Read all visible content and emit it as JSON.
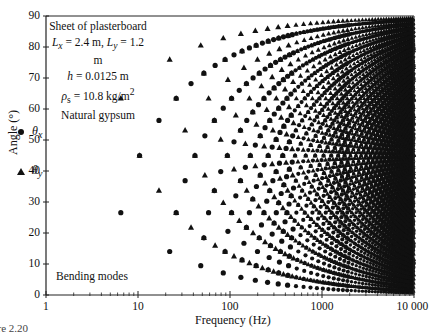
{
  "chart_data": {
    "type": "scatter",
    "title": "",
    "xlabel": "Frequency (Hz)",
    "ylabel": "Angle (°)",
    "xscale": "log",
    "xlim": [
      1,
      10000
    ],
    "ylim": [
      0,
      90
    ],
    "x_ticks": [
      "1",
      "10",
      "100",
      "1000",
      "10 000"
    ],
    "y_ticks": [
      "0",
      "10",
      "20",
      "30",
      "40",
      "50",
      "60",
      "70",
      "80",
      "90"
    ],
    "grid": false,
    "legend": [
      {
        "marker": "circle",
        "label": "θx"
      },
      {
        "marker": "triangle",
        "label": "θy"
      }
    ],
    "annotations": {
      "info_lines": [
        "Sheet of plasterboard",
        "Lx = 2.4 m, Ly = 1.2 m",
        "h = 0.0125 m",
        "ρs = 10.8 kg/m²",
        "Natural gypsum"
      ],
      "corner_text": "Bending modes"
    },
    "model": {
      "Lx": 2.4,
      "Ly": 1.2,
      "freq_constant": 7.49,
      "formula": "f = C*((m/Lx)^2 + (n/Ly)^2); thetay = atan((n/Ly)/(m/Lx)); thetax = 90 - thetay",
      "fmax": 10000
    },
    "series": [
      {
        "name": "θx",
        "marker": "circle",
        "points": [
          {
            "mode": "1,1",
            "x": 6.5,
            "y": 26.6
          },
          {
            "mode": "2,1",
            "x": 10.4,
            "y": 45.0
          },
          {
            "mode": "3,1",
            "x": 16.9,
            "y": 56.3
          },
          {
            "mode": "1,2",
            "x": 22.1,
            "y": 14.0
          },
          {
            "mode": "2,2",
            "x": 26.0,
            "y": 26.6
          },
          {
            "mode": "4,1",
            "x": 26.0,
            "y": 63.4
          },
          {
            "mode": "3,2",
            "x": 32.5,
            "y": 36.9
          },
          {
            "mode": "5,1",
            "x": 37.7,
            "y": 68.2
          },
          {
            "mode": "4,2",
            "x": 41.6,
            "y": 45.0
          },
          {
            "mode": "1,3",
            "x": 48.1,
            "y": 9.5
          }
        ]
      },
      {
        "name": "θy",
        "marker": "triangle",
        "points": [
          {
            "mode": "1,1",
            "x": 6.5,
            "y": 63.4
          },
          {
            "mode": "2,1",
            "x": 10.4,
            "y": 45.0
          },
          {
            "mode": "3,1",
            "x": 16.9,
            "y": 33.7
          },
          {
            "mode": "1,2",
            "x": 22.1,
            "y": 76.0
          },
          {
            "mode": "2,2",
            "x": 26.0,
            "y": 63.4
          },
          {
            "mode": "4,1",
            "x": 26.0,
            "y": 26.6
          },
          {
            "mode": "3,2",
            "x": 32.5,
            "y": 53.1
          },
          {
            "mode": "5,1",
            "x": 37.7,
            "y": 21.8
          },
          {
            "mode": "4,2",
            "x": 41.6,
            "y": 45.0
          },
          {
            "mode": "1,3",
            "x": 48.1,
            "y": 80.5
          }
        ]
      }
    ]
  },
  "figure": {
    "caption_fragment": "ure 2.20"
  },
  "colors": {
    "marker": "#111111",
    "axis": "#222222",
    "background": "#ffffff"
  },
  "info": {
    "line1": "Sheet of plasterboard",
    "lx_sym": "L",
    "lx_sub": "x",
    "lx_val": " = 2.4 m, ",
    "ly_sym": "L",
    "ly_sub": "y",
    "ly_val": " = 1.2 m",
    "h_sym": "h",
    "h_val": " = 0.0125 m",
    "rho_sym": "ρ",
    "rho_sub": "s",
    "rho_val": " = 10.8 kg/m",
    "rho_exp": "2",
    "line5": "Natural gypsum"
  },
  "legend": {
    "circle_sym": "θ",
    "circle_sub": "x",
    "triangle_sym": "θ",
    "triangle_sub": "y"
  },
  "text": {
    "bending": "Bending modes",
    "xlabel": "Frequency (Hz)",
    "ylabel": "Angle (°)"
  }
}
